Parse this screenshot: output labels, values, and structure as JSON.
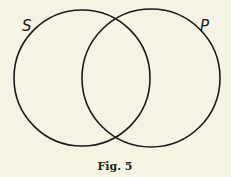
{
  "diagram": {
    "type": "venn",
    "circles": [
      {
        "label": "S",
        "cx": 82,
        "cy": 78,
        "r": 68
      },
      {
        "label": "P",
        "cx": 151,
        "cy": 78,
        "r": 69
      }
    ],
    "caption": "Fig. 5",
    "colors": {
      "background": "#f5f3e4",
      "stroke": "#1a1a1a"
    }
  }
}
